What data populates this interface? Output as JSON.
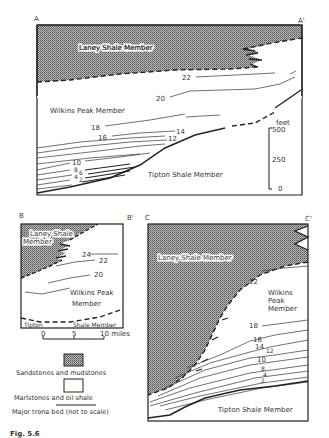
{
  "figure": {
    "caption": "Fig. 5.6",
    "panels": {
      "A": {
        "corner_left": "A",
        "corner_right": "A'",
        "labels": {
          "top": "Laney Shale Member",
          "middle": "Wilkins Peak Member",
          "bottom": "Tipton Shale Member"
        },
        "bed_numbers": [
          "22",
          "20",
          "18",
          "16",
          "14",
          "12",
          "10",
          "8",
          "6",
          "4",
          "2"
        ],
        "scale": {
          "unit": "feet",
          "ticks": [
            "500",
            "250",
            "0"
          ]
        }
      },
      "B": {
        "corner_left": "B",
        "corner_right": "B'",
        "labels": {
          "top_line1": "Laney Shale",
          "top_line2": "Member",
          "middle_line1": "Wilkins Peak",
          "middle_line2": "Member",
          "bottom_left": "Tipton",
          "bottom_right": "Shale Member"
        },
        "bed_numbers": [
          "24",
          "22",
          "20"
        ]
      },
      "C": {
        "corner_left": "C",
        "corner_right": "C'",
        "labels": {
          "top": "Laney Shale Member",
          "middle_line1": "Wilkins",
          "middle_line2": "Peak",
          "middle_line3": "Member",
          "bottom": "Tipton Shale Member"
        },
        "bed_numbers": [
          "22",
          "18",
          "16",
          "14",
          "12",
          "10",
          "8",
          "4",
          "2"
        ]
      }
    },
    "horizontal_scale": {
      "ticks": [
        "0",
        "5",
        "10 miles"
      ]
    },
    "legend": [
      {
        "symbol": "stippled-box",
        "label": "Sandstones and mudstones"
      },
      {
        "symbol": "empty-box",
        "label": "Marlstones and oil shale"
      },
      {
        "symbol": "line",
        "label": "Major trona bed (not to scale)"
      }
    ],
    "colors": {
      "stipple": "#8a8a8a",
      "line": "#222222",
      "background": "#ffffff"
    }
  }
}
